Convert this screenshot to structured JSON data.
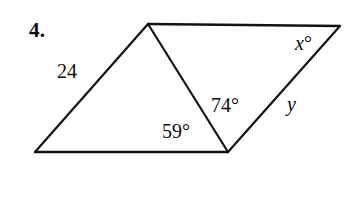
{
  "figure": {
    "problem_number": "4.",
    "stroke_color": "#121212",
    "background_color": "#fefefe",
    "stroke_width": 2.2,
    "vertices": {
      "bottom_left": {
        "x": 35,
        "y": 152
      },
      "top_left": {
        "x": 148,
        "y": 24
      },
      "top_right": {
        "x": 340,
        "y": 26
      },
      "bottom_right": {
        "x": 228,
        "y": 152
      }
    },
    "edges": [
      {
        "name": "left-side",
        "from": "bottom_left",
        "to": "top_left"
      },
      {
        "name": "top-side",
        "from": "top_left",
        "to": "top_right"
      },
      {
        "name": "right-side",
        "from": "top_right",
        "to": "bottom_right"
      },
      {
        "name": "bottom-side",
        "from": "bottom_right",
        "to": "bottom_left"
      },
      {
        "name": "diagonal",
        "from": "top_left",
        "to": "bottom_right"
      }
    ],
    "labels": {
      "side_24": "24",
      "angle_59": "59",
      "angle_74": "74",
      "angle_x": "x",
      "side_y": "y",
      "degree_symbol": "°"
    }
  }
}
